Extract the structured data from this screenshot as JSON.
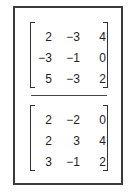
{
  "matrices": [
    {
      "name": "matrix-a",
      "rows": [
        [
          "2",
          "−3",
          "4"
        ],
        [
          "−3",
          "−1",
          "0"
        ],
        [
          "5",
          "−3",
          "2"
        ]
      ]
    },
    {
      "name": "matrix-b",
      "rows": [
        [
          "2",
          "−2",
          "0"
        ],
        [
          "2",
          "3",
          "4"
        ],
        [
          "3",
          "−1",
          "2"
        ]
      ]
    }
  ]
}
